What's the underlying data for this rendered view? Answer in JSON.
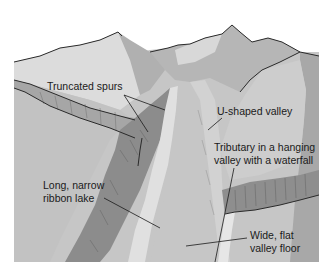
{
  "diagram": {
    "labels": {
      "truncated_spurs": "Truncated spurs",
      "u_shaped_valley": "U-shaped valley",
      "tributary_line1": "Tributary in a hanging",
      "tributary_line2": "valley with a waterfall",
      "ribbon_lake_line1": "Long, narrow",
      "ribbon_lake_line2": "ribbon lake",
      "valley_floor_line1": "Wide, flat",
      "valley_floor_line2": "valley floor"
    },
    "colors": {
      "background": "#ffffff",
      "light_slope": "#d6d6d6",
      "mid_slope": "#b4b4b4",
      "valley_floor": "#c4c4c4",
      "dark_rock": "#8a8a8a",
      "lake": "#e2e2e2",
      "outline": "#2a2a2a"
    }
  }
}
